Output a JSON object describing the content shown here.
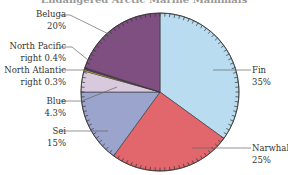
{
  "chart_data": {
    "type": "pie",
    "title": "Endangered Arctic Marine Mammals",
    "categories": [
      "Fin",
      "Narwhal",
      "Sei",
      "Blue",
      "North Atlantic right",
      "North Pacific right",
      "Beluga"
    ],
    "values": [
      35,
      25,
      15,
      4.3,
      0.3,
      0.4,
      20
    ],
    "unit": "%",
    "start_angle": "12 o'clock",
    "direction": "clockwise",
    "colors": [
      "#b9dcf0",
      "#e1676c",
      "#9aa4cc",
      "#d9c9dd",
      "#f3d23a",
      "#5e3a6a",
      "#7f4f82"
    ],
    "labels": [
      {
        "name": "Fin",
        "pct": "35%",
        "side": "right"
      },
      {
        "name": "Narwhal",
        "pct": "25%",
        "side": "right"
      },
      {
        "name": "Sei",
        "pct": "15%",
        "side": "left"
      },
      {
        "name": "Blue",
        "pct": "4.3%",
        "side": "left"
      },
      {
        "name": "North Atlantic",
        "pct": "right 0.3%",
        "side": "left"
      },
      {
        "name": "North Pacific",
        "pct": "right 0.4%",
        "side": "left"
      },
      {
        "name": "Beluga",
        "pct": "20%",
        "side": "left"
      }
    ]
  },
  "labels": {
    "beluga": {
      "line1": "Beluga",
      "line2": "20%"
    },
    "np": {
      "line1": "North Pacific",
      "line2": "right 0.4%"
    },
    "na": {
      "line1": "North Atlantic",
      "line2": "right 0.3%"
    },
    "blue": {
      "line1": "Blue",
      "line2": "4.3%"
    },
    "sei": {
      "line1": "Sei",
      "line2": "15%"
    },
    "fin": {
      "line1": "Fin",
      "line2": "35%"
    },
    "narwhal": {
      "line1": "Narwhal",
      "line2": "25%"
    }
  }
}
